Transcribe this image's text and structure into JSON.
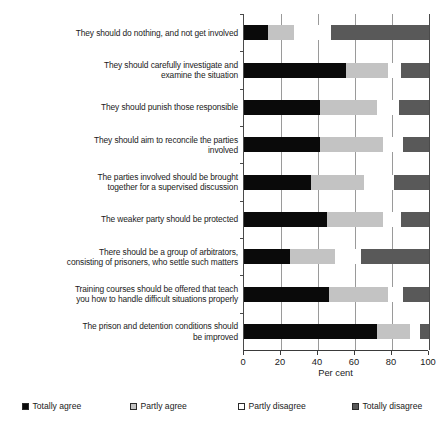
{
  "chart_data": {
    "type": "bar",
    "orientation": "horizontal",
    "stacked": true,
    "stack_mode": "percent",
    "title": "",
    "xlabel": "Per cent",
    "ylabel": "",
    "xlim": [
      0,
      100
    ],
    "xticks": [
      0,
      20,
      40,
      60,
      80,
      100
    ],
    "xticklabels": [
      "0",
      "20",
      "40",
      "60",
      "80",
      "100"
    ],
    "grid": "vertical",
    "legend_position": "bottom",
    "categories": [
      "They should do nothing, and not get involved",
      "They should carefully investigate and\nexamine the situation",
      "They should punish those responsible",
      "They should aim to reconcile the parties\ninvolved",
      "The parties involved should be brought\ntogether for a supervised discussion",
      "The weaker party should be protected",
      "There should be a group of arbitrators,\nconsisting of prisoners, who settle such matters",
      "Training courses should be offered that teach\nyou how to handle difficult situations properly",
      "The prison and detention conditions should\nbe improved"
    ],
    "series": [
      {
        "name": "Totally agree",
        "color": "#0a0a0a",
        "values": [
          13,
          55,
          41,
          41,
          36,
          45,
          25,
          46,
          72
        ]
      },
      {
        "name": "Partly agree",
        "color": "#c3c3c3",
        "values": [
          14,
          23,
          31,
          34,
          29,
          30,
          24,
          32,
          18
        ]
      },
      {
        "name": "Partly disagree",
        "color": "#ffffff",
        "values": [
          20,
          7,
          12,
          11,
          16,
          10,
          14,
          8,
          5
        ]
      },
      {
        "name": "Totally disagree",
        "color": "#595959",
        "values": [
          53,
          15,
          16,
          14,
          19,
          15,
          37,
          14,
          5
        ]
      }
    ]
  }
}
